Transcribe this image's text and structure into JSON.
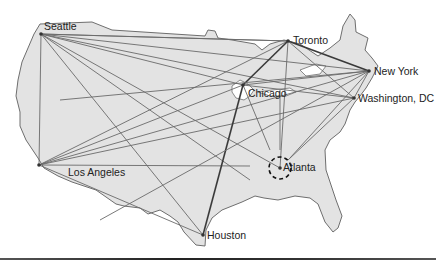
{
  "map": {
    "land_color": "#e3e3e3",
    "border_color": "#6e6e6e",
    "route_color": "#6a6a6a",
    "highlight_route_color": "#3a3a3a",
    "outline": "M40,24 L92,22 L112,30 L205,36 L208,30 L215,31 L218,38 L232,40 L255,44 L262,50 L270,44 L284,40 L300,44 L318,56 L330,48 L340,40 L343,26 L350,14 L355,20 L356,32 L368,38 L365,50 L372,58 L378,66 L372,78 L366,88 L360,96 L355,102 L350,110 L345,124 L340,132 L330,140 L325,150 L326,170 L332,188 L336,200 L342,216 L338,228 L333,232 L325,222 L318,204 L310,198 L295,196 L278,200 L264,198 L255,196 L242,202 L232,206 L222,210 L212,218 L206,230 L205,246 L196,245 L184,232 L178,222 L170,216 L160,210 L148,214 L140,208 L124,206 L116,204 L96,190 L72,182 L58,176 L44,168 L38,158 L26,140 L20,126 L20,112 L16,96 L18,80 L22,62 L28,48 L34,34 Z",
    "lakes": [
      "M232,86 L240,80 L248,84 L254,90 L250,96 L244,100 L236,98 L232,92 Z",
      "M258,92 L272,90 L290,88 L296,92 L286,96 L270,96 Z",
      "M300,70 L316,64 L326,66 L320,74 L306,76 Z"
    ]
  },
  "cities": [
    {
      "name": "Seattle",
      "x": 41,
      "y": 34,
      "label_x": 44,
      "label_y": 20
    },
    {
      "name": "Toronto",
      "x": 288,
      "y": 41,
      "label_x": 293,
      "label_y": 34
    },
    {
      "name": "New York",
      "x": 369,
      "y": 71,
      "label_x": 374,
      "label_y": 65
    },
    {
      "name": "Chicago",
      "x": 243,
      "y": 85,
      "label_x": 248,
      "label_y": 87
    },
    {
      "name": "Washington, DC",
      "x": 354,
      "y": 98,
      "label_x": 358,
      "label_y": 92
    },
    {
      "name": "Los Angeles",
      "x": 39,
      "y": 165,
      "label_x": 68,
      "label_y": 166
    },
    {
      "name": "Atlanta",
      "x": 280,
      "y": 168,
      "label_x": 283,
      "label_y": 161
    },
    {
      "name": "Houston",
      "x": 203,
      "y": 235,
      "label_x": 207,
      "label_y": 229
    }
  ],
  "hub": {
    "name": "Atlanta",
    "x": 280,
    "y": 168,
    "radius": 11
  },
  "routes": [
    {
      "from": [
        41,
        34
      ],
      "to": [
        288,
        41
      ]
    },
    {
      "from": [
        41,
        34
      ],
      "to": [
        369,
        71
      ]
    },
    {
      "from": [
        41,
        34
      ],
      "to": [
        354,
        98
      ]
    },
    {
      "from": [
        41,
        34
      ],
      "to": [
        243,
        85
      ]
    },
    {
      "from": [
        41,
        34
      ],
      "to": [
        39,
        165
      ]
    },
    {
      "from": [
        41,
        34
      ],
      "to": [
        203,
        235
      ]
    },
    {
      "from": [
        41,
        34
      ],
      "to": [
        280,
        168
      ]
    },
    {
      "from": [
        41,
        34
      ],
      "to": [
        250,
        180
      ]
    },
    {
      "from": [
        39,
        165
      ],
      "to": [
        288,
        41
      ]
    },
    {
      "from": [
        39,
        165
      ],
      "to": [
        369,
        71
      ]
    },
    {
      "from": [
        39,
        165
      ],
      "to": [
        354,
        98
      ]
    },
    {
      "from": [
        39,
        165
      ],
      "to": [
        243,
        85
      ]
    },
    {
      "from": [
        39,
        165
      ],
      "to": [
        203,
        235
      ]
    },
    {
      "from": [
        39,
        165
      ],
      "to": [
        250,
        166
      ]
    },
    {
      "from": [
        288,
        41
      ],
      "to": [
        369,
        71
      ],
      "highlight": true
    },
    {
      "from": [
        288,
        41
      ],
      "to": [
        354,
        98
      ]
    },
    {
      "from": [
        288,
        41
      ],
      "to": [
        243,
        85
      ],
      "highlight": true
    },
    {
      "from": [
        288,
        41
      ],
      "to": [
        280,
        168
      ]
    },
    {
      "from": [
        288,
        41
      ],
      "to": [
        41,
        34
      ]
    },
    {
      "from": [
        243,
        85
      ],
      "to": [
        369,
        71
      ]
    },
    {
      "from": [
        243,
        85
      ],
      "to": [
        354,
        98
      ]
    },
    {
      "from": [
        243,
        85
      ],
      "to": [
        270,
        150
      ]
    },
    {
      "from": [
        203,
        235
      ],
      "to": [
        243,
        85
      ],
      "highlight": true
    },
    {
      "from": [
        354,
        98
      ],
      "to": [
        369,
        71
      ]
    },
    {
      "from": [
        354,
        98
      ],
      "to": [
        288,
        160
      ]
    },
    {
      "from": [
        369,
        71
      ],
      "to": [
        290,
        158
      ]
    },
    {
      "from": [
        280,
        150
      ],
      "to": [
        280,
        90
      ]
    },
    {
      "from": [
        100,
        220
      ],
      "to": [
        369,
        71
      ]
    },
    {
      "from": [
        60,
        100
      ],
      "to": [
        369,
        71
      ]
    }
  ]
}
